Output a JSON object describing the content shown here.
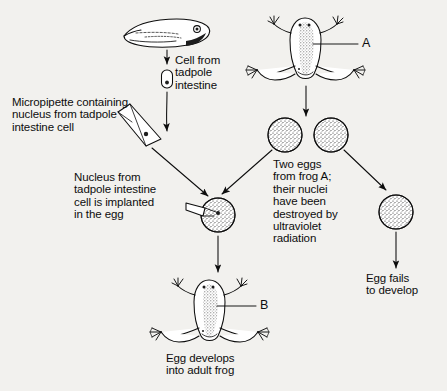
{
  "diagram": {
    "background_color": "#f2f1ee",
    "ink_color": "#0d0d0d"
  },
  "labels": {
    "cell_from_tadpole_intestine": "Cell from\ntadpole\nintestine",
    "micropipette": "Micropipette containing\nnucleus from tadpole\nintestine cell",
    "nucleus_implanted": "Nucleus from\ntadpole intestine\ncell is implanted\nin the egg",
    "two_eggs": "Two eggs\nfrom frog A;\ntheir nuclei\nhave been\ndestroyed by\nultraviolet\nradiation",
    "egg_fails": "Egg fails\nto develop",
    "egg_develops": "Egg develops\ninto adult frog",
    "frog_a": "A",
    "frog_b": "B"
  },
  "figures": {
    "tadpole": "tadpole-drawing",
    "intestine_cell": "intestine-cell-drawing",
    "micropipette": "micropipette-drawing",
    "frog_a": "adult-frog-a-drawing",
    "frog_b": "adult-frog-b-drawing",
    "egg_left": "enucleated-egg-left",
    "egg_right": "enucleated-egg-right",
    "injected_egg": "injected-egg",
    "failed_egg": "failing-egg"
  },
  "arrows": [
    {
      "name": "tadpole-to-cell"
    },
    {
      "name": "cell-to-injected-egg"
    },
    {
      "name": "micropipette-to-injected-egg"
    },
    {
      "name": "frog-a-to-eggs"
    },
    {
      "name": "egg-left-to-injected-egg"
    },
    {
      "name": "egg-right-to-failed-egg"
    },
    {
      "name": "injected-egg-to-frog-b"
    },
    {
      "name": "failed-egg-to-outcome"
    }
  ]
}
